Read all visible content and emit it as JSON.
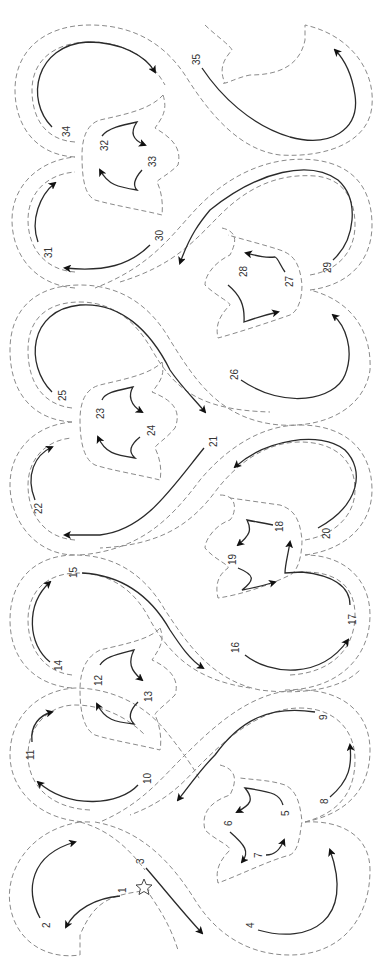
{
  "diagram": {
    "type": "quilting stitch path",
    "orientation": "rotated 90 degrees (read bottom to top)",
    "start_marker": "star-icon",
    "colors": {
      "outline": "#8a8a8a",
      "stitch": "#2a2a2a",
      "background": "#ffffff"
    },
    "steps": [
      {
        "n": "1",
        "x": 126,
        "y": 893
      },
      {
        "n": "2",
        "x": 47,
        "y": 925
      },
      {
        "n": "3",
        "x": 141,
        "y": 860
      },
      {
        "n": "4",
        "x": 250,
        "y": 924
      },
      {
        "n": "5",
        "x": 286,
        "y": 812
      },
      {
        "n": "6",
        "x": 229,
        "y": 822
      },
      {
        "n": "7",
        "x": 259,
        "y": 855
      },
      {
        "n": "8",
        "x": 324,
        "y": 800
      },
      {
        "n": "9",
        "x": 323,
        "y": 716
      },
      {
        "n": "10",
        "x": 147,
        "y": 779
      },
      {
        "n": "11",
        "x": 30,
        "y": 755
      },
      {
        "n": "12",
        "x": 98,
        "y": 681
      },
      {
        "n": "13",
        "x": 148,
        "y": 697
      },
      {
        "n": "14",
        "x": 58,
        "y": 666
      },
      {
        "n": "15",
        "x": 73,
        "y": 573
      },
      {
        "n": "16",
        "x": 235,
        "y": 648
      },
      {
        "n": "17",
        "x": 352,
        "y": 620
      },
      {
        "n": "18",
        "x": 279,
        "y": 527
      },
      {
        "n": "19",
        "x": 232,
        "y": 560
      },
      {
        "n": "20",
        "x": 326,
        "y": 534
      },
      {
        "n": "21",
        "x": 213,
        "y": 442
      },
      {
        "n": "22",
        "x": 38,
        "y": 509
      },
      {
        "n": "23",
        "x": 100,
        "y": 414
      },
      {
        "n": "24",
        "x": 151,
        "y": 431
      },
      {
        "n": "25",
        "x": 62,
        "y": 396
      },
      {
        "n": "26",
        "x": 234,
        "y": 375
      },
      {
        "n": "27",
        "x": 289,
        "y": 282
      },
      {
        "n": "28",
        "x": 243,
        "y": 272
      },
      {
        "n": "29",
        "x": 327,
        "y": 268
      },
      {
        "n": "30",
        "x": 159,
        "y": 236
      },
      {
        "n": "31",
        "x": 48,
        "y": 253
      },
      {
        "n": "32",
        "x": 104,
        "y": 146
      },
      {
        "n": "33",
        "x": 152,
        "y": 162
      },
      {
        "n": "34",
        "x": 66,
        "y": 132
      },
      {
        "n": "35",
        "x": 196,
        "y": 60
      }
    ]
  }
}
